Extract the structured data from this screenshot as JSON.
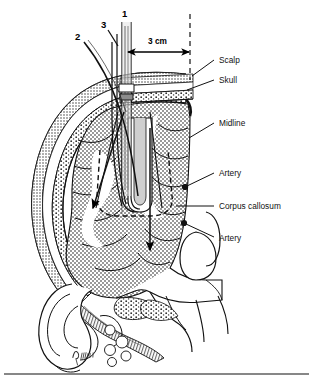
{
  "figure": {
    "numbered_markers": [
      {
        "id": "1",
        "x": 122,
        "y": 17
      },
      {
        "id": "2",
        "x": 78,
        "y": 37
      },
      {
        "id": "3",
        "x": 103,
        "y": 24
      }
    ],
    "dimension": {
      "label": "3 cm",
      "x": 148,
      "y": 43,
      "arrow_y": 52,
      "arrow_x1": 127,
      "arrow_x2": 190
    },
    "labels": [
      {
        "text": "Scalp",
        "x": 219,
        "y": 62,
        "lx1": 215,
        "ly1": 60,
        "lx2": 191,
        "ly2": 76
      },
      {
        "text": "Skull",
        "x": 219,
        "y": 82,
        "lx1": 215,
        "ly1": 80,
        "lx2": 186,
        "ly2": 90
      },
      {
        "text": "Midline",
        "x": 219,
        "y": 125,
        "lx1": 215,
        "ly1": 123,
        "lx2": 188,
        "ly2": 137
      },
      {
        "text": "Artery",
        "x": 219,
        "y": 175,
        "lx1": 215,
        "ly1": 173,
        "lx2": 185,
        "ly2": 186
      },
      {
        "text": "Corpus callosum",
        "x": 219,
        "y": 209,
        "lx1": 215,
        "ly1": 206,
        "lx2": 176,
        "ly2": 206
      },
      {
        "text": "Artery",
        "x": 219,
        "y": 240,
        "lx1": 215,
        "ly1": 237,
        "lx2": 185,
        "ly2": 224
      }
    ],
    "anatomy": {
      "scalp_layers": 4,
      "brain_fill": "stipple-gray",
      "ventricle_outline": "dashed",
      "midline_reference": "dashed-vertical"
    },
    "trajectory_arrows": [
      {
        "name": "oblique-anterolateral",
        "x1": 124,
        "y1": 112,
        "x2": 92,
        "y2": 212
      },
      {
        "name": "vertical-inferior",
        "x1": 150,
        "y1": 128,
        "x2": 150,
        "y2": 255
      }
    ],
    "signature": "artist-signature"
  },
  "colors": {
    "ink": "#111111",
    "tissue": "#a8a8a8",
    "bone": "#d8d8d8",
    "background": "#ffffff"
  }
}
